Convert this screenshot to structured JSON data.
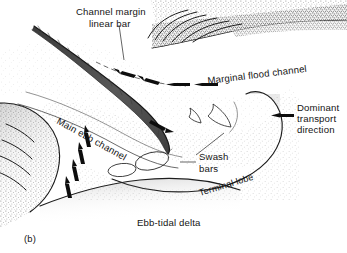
{
  "figure": {
    "panel_label": "(b)",
    "caption_label": "Ebb-tidal delta",
    "type": "geomorphological-block-diagram",
    "background_color": "#ffffff",
    "ink_color": "#141414"
  },
  "labels": {
    "channel_margin_line1": "Channel margin",
    "channel_margin_line2": "linear bar",
    "main_ebb_channel": "Main ebb channel",
    "marginal_flood_channel": "Marginal flood channel",
    "dominant_line1": "Dominant",
    "dominant_line2": "transport",
    "dominant_line3": "direction",
    "swash_line1": "Swash",
    "swash_line2": "bars",
    "terminal_lobe": "Terminal lobe"
  },
  "features": {
    "channel_margin_linear_bar": "dark stippled elongated bar with hatch ticks",
    "main_ebb_channel": "curving channel trending NW-SE then bending south",
    "marginal_flood_channel": "flood channel marked by four left-pointing arrows",
    "swash_bars_crescent_count": 2,
    "swash_bars_ellipse_count": 2,
    "terminal_lobe": "rounded seaward bulge with stippled dark margin",
    "beach_ridges_left_count": 4,
    "beach_ridges_top_right_count": 6,
    "ebb_flow_arrows_count": 1,
    "flood_arrows_count": 4,
    "landward_arrows_count": 4
  },
  "arrows": {
    "marginal_flood": [
      {
        "x": 120,
        "y": 69,
        "dir": "left-up"
      },
      {
        "x": 140,
        "y": 76,
        "dir": "left-up"
      },
      {
        "x": 168,
        "y": 82,
        "dir": "left"
      },
      {
        "x": 196,
        "y": 82,
        "dir": "left"
      }
    ],
    "landward_flood": [
      {
        "x": 86,
        "y": 140,
        "dir": "up"
      },
      {
        "x": 80,
        "y": 156,
        "dir": "up"
      },
      {
        "x": 74,
        "y": 172,
        "dir": "up"
      },
      {
        "x": 68,
        "y": 188,
        "dir": "up"
      }
    ],
    "ebb_outflow": [
      {
        "x": 162,
        "y": 125,
        "dir": "down-right"
      }
    ],
    "dominant_transport": [
      {
        "x": 274,
        "y": 113,
        "dir": "left"
      }
    ],
    "marginal_flood_label_arrow": [
      {
        "x": 200,
        "y": 81,
        "dir": "left"
      }
    ]
  }
}
